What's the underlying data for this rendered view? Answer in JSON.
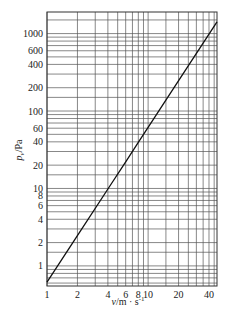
{
  "chart_data": {
    "type": "line",
    "title": "",
    "xlabel": "v/m·s⁻¹",
    "ylabel": "p_v/Pa",
    "xscale": "log",
    "yscale": "log",
    "xlim": [
      1,
      48
    ],
    "ylim": [
      0.55,
      1900
    ],
    "grid": true,
    "x_ticks": [
      1,
      2,
      4,
      6,
      8,
      10,
      20,
      40
    ],
    "x_tick_labels": [
      "1",
      "2",
      "4",
      "6",
      "8",
      "10",
      "20",
      "40"
    ],
    "x_gridlines": [
      1,
      2,
      3,
      4,
      5,
      6,
      7,
      8,
      9,
      10,
      15,
      20,
      25,
      30,
      35,
      40,
      45
    ],
    "y_ticks": [
      1,
      2,
      4,
      6,
      8,
      10,
      20,
      40,
      60,
      100,
      200,
      400,
      600,
      1000
    ],
    "y_tick_labels": [
      "1",
      "2",
      "4",
      "6",
      "8",
      "10",
      "20",
      "40",
      "60",
      "100",
      "200",
      "400",
      "600",
      "1000"
    ],
    "y_gridlines": [
      0.6,
      0.7,
      0.8,
      0.9,
      1,
      1.5,
      2,
      3,
      4,
      5,
      6,
      7,
      8,
      9,
      10,
      15,
      20,
      30,
      40,
      50,
      60,
      70,
      80,
      90,
      100,
      150,
      200,
      300,
      400,
      500,
      600,
      700,
      800,
      900,
      1000,
      1500
    ],
    "series": [
      {
        "name": "p_v = 0.615·v²",
        "x": [
          1,
          2,
          4,
          6,
          8,
          10,
          20,
          40,
          48
        ],
        "y": [
          0.615,
          2.46,
          9.84,
          22.1,
          39.4,
          61.5,
          246,
          984,
          1417
        ]
      }
    ],
    "legend": null
  },
  "labels": {
    "xlabel_var": "v",
    "xlabel_unit": "/m · s",
    "xlabel_exp": "-1",
    "ylabel_var": "p",
    "ylabel_sub": "v",
    "ylabel_unit": "/Pa"
  }
}
